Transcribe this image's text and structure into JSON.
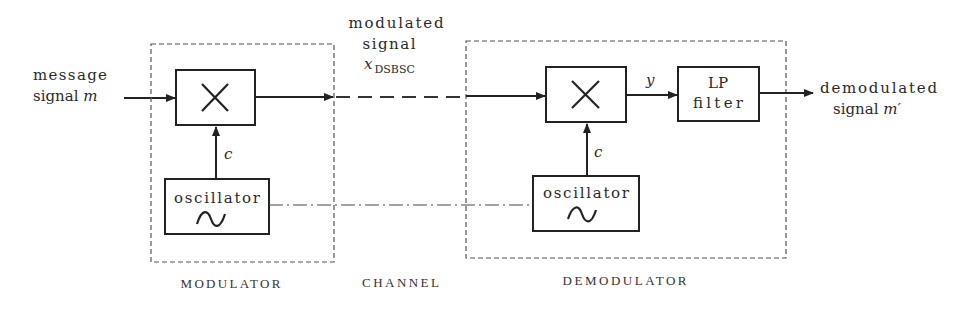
{
  "diagram": {
    "type": "block-diagram",
    "input": {
      "line1": "message",
      "line2": "signal ",
      "symbol": "m"
    },
    "channel_signal": {
      "line1": "modulated",
      "line2": "signal",
      "symbol": "x",
      "subscript": "DSBSC"
    },
    "output": {
      "line1": "demodulated",
      "line2": "signal ",
      "symbol": "m′"
    },
    "modulator": {
      "label": "MODULATOR",
      "multiplier_icon": "multiply-x",
      "carrier_label": "c",
      "oscillator": {
        "label": "oscillator",
        "icon": "sine-wave"
      }
    },
    "channel": {
      "label": "CHANNEL"
    },
    "demodulator": {
      "label": "DEMODULATOR",
      "multiplier_icon": "multiply-x",
      "carrier_label": "c",
      "intermediate_label": "y",
      "filter": {
        "line1": "LP",
        "line2": "filter"
      },
      "oscillator": {
        "label": "oscillator",
        "icon": "sine-wave"
      }
    },
    "colors": {
      "line": "#222222",
      "text": "#2a2a2a",
      "background": "#ffffff"
    }
  }
}
